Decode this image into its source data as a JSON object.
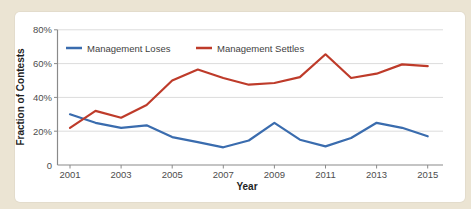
{
  "figure": {
    "background_color": "#ebe4d3",
    "panel_color": "#ffffff"
  },
  "chart_data": {
    "type": "line",
    "title": "",
    "xlabel": "Year",
    "ylabel": "Fraction of Contests",
    "x": [
      2001,
      2002,
      2003,
      2004,
      2005,
      2006,
      2007,
      2008,
      2009,
      2010,
      2011,
      2012,
      2013,
      2014,
      2015
    ],
    "x_tick_labels": [
      "2001",
      "2003",
      "2005",
      "2007",
      "2009",
      "2011",
      "2013",
      "2015"
    ],
    "y_ticks": [
      {
        "value": 0,
        "label": "0"
      },
      {
        "value": 20,
        "label": "20%"
      },
      {
        "value": 40,
        "label": "40%"
      },
      {
        "value": 60,
        "label": "60%"
      },
      {
        "value": 80,
        "label": "80%"
      }
    ],
    "ylim": [
      0,
      80
    ],
    "grid": "horizontal",
    "legend_position": "top-left-inside",
    "series": [
      {
        "name": "Management Loses",
        "color": "#3a6cae",
        "values": [
          30,
          25,
          22,
          23.5,
          16.5,
          13.5,
          10.5,
          14.5,
          25,
          15,
          11,
          16,
          25,
          22,
          17
        ]
      },
      {
        "name": "Management Settles",
        "color": "#be3b2a",
        "values": [
          22,
          32,
          28,
          35.5,
          50,
          56.5,
          51.5,
          47.5,
          48.5,
          52,
          65.5,
          51.5,
          54,
          59.5,
          58.5
        ]
      }
    ],
    "style": {
      "grid_color": "#dcdcdc",
      "axis_color": "#8a8a8a",
      "tick_text_color": "#4d4d4d",
      "title_text_color": "#1f1f1f",
      "legend_text_color": "#3f3f3f"
    }
  }
}
